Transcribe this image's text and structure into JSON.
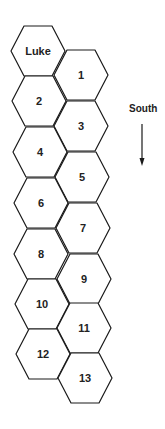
{
  "diagram": {
    "cells": [
      {
        "label": "Luke",
        "cx": 38,
        "cy": 51
      },
      {
        "label": "1",
        "cx": 81,
        "cy": 75
      },
      {
        "label": "2",
        "cx": 39,
        "cy": 101
      },
      {
        "label": "3",
        "cx": 81,
        "cy": 126
      },
      {
        "label": "4",
        "cx": 40,
        "cy": 152
      },
      {
        "label": "5",
        "cx": 82,
        "cy": 177
      },
      {
        "label": "6",
        "cx": 41,
        "cy": 203
      },
      {
        "label": "7",
        "cx": 83,
        "cy": 228
      },
      {
        "label": "8",
        "cx": 41,
        "cy": 254
      },
      {
        "label": "9",
        "cx": 84,
        "cy": 279
      },
      {
        "label": "10",
        "cx": 42,
        "cy": 304
      },
      {
        "label": "11",
        "cx": 84,
        "cy": 328
      },
      {
        "label": "12",
        "cx": 43,
        "cy": 354
      },
      {
        "label": "13",
        "cx": 85,
        "cy": 378
      }
    ],
    "direction_label": "South",
    "colors": {
      "stroke": "#1a1a1a",
      "text": "#222222",
      "background": "#ffffff"
    }
  }
}
